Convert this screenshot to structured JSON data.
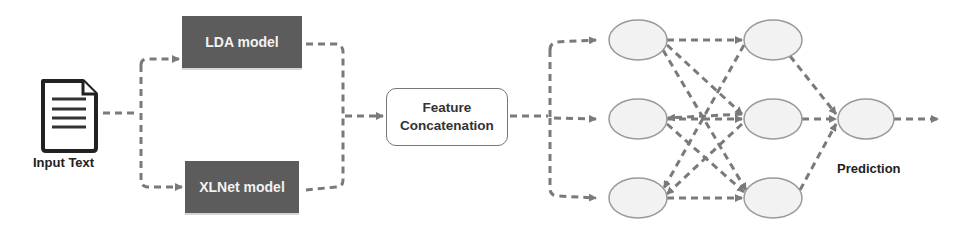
{
  "diagram": {
    "input": {
      "label": "Input Text",
      "icon": "document-icon"
    },
    "models": [
      {
        "label": "LDA model"
      },
      {
        "label": "XLNet model"
      }
    ],
    "fusion": {
      "line1": "Feature",
      "line2": "Concatenation"
    },
    "network": {
      "input_layer_nodes": 3,
      "hidden_layer_nodes": 3,
      "output_nodes": 1,
      "connections": "fully-connected"
    },
    "output": {
      "label": "Prediction"
    },
    "colors": {
      "arrow": "#7a7a7a",
      "model_box": "#5c5c5c",
      "model_text": "#f2f2f2",
      "node_fill": "#f2f2f2",
      "node_stroke": "#9a9a9a",
      "text": "#222222"
    }
  }
}
